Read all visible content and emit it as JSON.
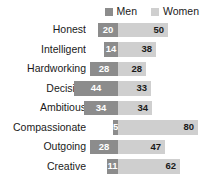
{
  "legend": {
    "items": [
      {
        "label": "Men",
        "color": "#8c8c8c",
        "icon": "square-swatch-icon"
      },
      {
        "label": "Women",
        "color": "#cfcfcf",
        "icon": "square-swatch-icon"
      }
    ]
  },
  "chart_data": {
    "type": "bar",
    "subtype": "diverging-stacked-horizontal-bar",
    "title": "",
    "xlabel": "",
    "ylabel": "",
    "grid": false,
    "legend_position": "top-right",
    "axis_origin": "men-women-boundary",
    "categories": [
      "Honest",
      "Intelligent",
      "Hardworking",
      "Decisive",
      "Ambitious",
      "Compassionate",
      "Outgoing",
      "Creative"
    ],
    "series": [
      {
        "name": "Men",
        "color": "#8c8c8c",
        "values": [
          20,
          14,
          28,
          44,
          34,
          5,
          28,
          11
        ]
      },
      {
        "name": "Women",
        "color": "#cfcfcf",
        "values": [
          50,
          38,
          28,
          33,
          34,
          80,
          47,
          62
        ]
      }
    ],
    "value_labels": [
      {
        "category": "Honest",
        "men": "20",
        "women": "50"
      },
      {
        "category": "Intelligent",
        "men": "14",
        "women": "38"
      },
      {
        "category": "Hardworking",
        "men": "28",
        "women": "28"
      },
      {
        "category": "Decisive",
        "men": "44",
        "women": "33"
      },
      {
        "category": "Ambitious",
        "men": "34",
        "women": "34"
      },
      {
        "category": "Compassionate",
        "men": "5",
        "women": "80"
      },
      {
        "category": "Outgoing",
        "men": "28",
        "women": "47"
      },
      {
        "category": "Creative",
        "men": "11",
        "women": "62"
      }
    ],
    "xlim": [
      0,
      80
    ],
    "units": "percent"
  }
}
